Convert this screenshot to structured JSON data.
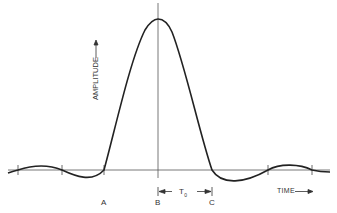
{
  "diagram": {
    "type": "pulse waveform (sinc-like)",
    "labels": {
      "y_axis": "AMPLITUDE",
      "x_axis": "TIME",
      "point_a": "A",
      "point_b": "B",
      "point_c": "C",
      "interval": "T",
      "interval_sub": "0"
    },
    "colors": {
      "line": "#222222",
      "axis": "#555555",
      "background": "#ffffff"
    }
  }
}
